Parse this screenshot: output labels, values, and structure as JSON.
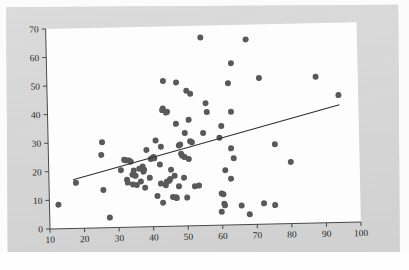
{
  "figure": {
    "background_color": "#d9d9d9",
    "plot_background_color": "#ffffff",
    "point_color": "#5a5a5a",
    "line_color": "#2e2e2e",
    "axis_color": "#4a4a4a"
  },
  "chart_data": {
    "type": "scatter",
    "title": "",
    "subtitle": "",
    "xlabel": "",
    "ylabel": "",
    "xlim": [
      10,
      100
    ],
    "ylim": [
      0,
      70
    ],
    "xticks": [
      10,
      20,
      30,
      40,
      50,
      60,
      70,
      80,
      90,
      100
    ],
    "yticks": [
      0,
      10,
      20,
      30,
      40,
      50,
      60,
      70
    ],
    "xticklabels": [
      "10",
      "20",
      "30",
      "40",
      "50",
      "60",
      "70",
      "80",
      "90",
      "100"
    ],
    "yticklabels": [
      "0",
      "10",
      "20",
      "30",
      "40",
      "50",
      "60",
      "70"
    ],
    "grid": false,
    "legend": null,
    "annotations": [],
    "marker": "circle",
    "marker_size": 3,
    "points": [
      [
        12.6,
        8.4
      ],
      [
        17.8,
        15.9
      ],
      [
        25.3,
        25.5
      ],
      [
        25.6,
        29.9
      ],
      [
        25.7,
        13.2
      ],
      [
        27.4,
        3.5
      ],
      [
        30.9,
        20.0
      ],
      [
        31.9,
        23.6
      ],
      [
        32.4,
        23.4
      ],
      [
        32.6,
        16.6
      ],
      [
        32.8,
        15.6
      ],
      [
        33.3,
        23.3
      ],
      [
        33.8,
        22.9
      ],
      [
        34.2,
        18.3
      ],
      [
        34.3,
        14.9
      ],
      [
        34.6,
        19.8
      ],
      [
        35.1,
        17.9
      ],
      [
        35.4,
        14.7
      ],
      [
        36.2,
        20.4
      ],
      [
        36.6,
        15.9
      ],
      [
        37.2,
        21.1
      ],
      [
        37.4,
        19.3
      ],
      [
        37.6,
        20.0
      ],
      [
        37.8,
        13.7
      ],
      [
        38.4,
        26.9
      ],
      [
        39.2,
        17.1
      ],
      [
        39.6,
        23.7
      ],
      [
        40.1,
        24.0
      ],
      [
        40.4,
        24.4
      ],
      [
        40.6,
        23.9
      ],
      [
        41.1,
        30.1
      ],
      [
        41.3,
        10.7
      ],
      [
        42.2,
        21.7
      ],
      [
        42.4,
        15.0
      ],
      [
        42.6,
        27.9
      ],
      [
        42.9,
        8.3
      ],
      [
        43.2,
        40.7
      ],
      [
        43.4,
        41.3
      ],
      [
        43.6,
        50.9
      ],
      [
        43.8,
        14.4
      ],
      [
        44.1,
        15.6
      ],
      [
        44.3,
        39.8
      ],
      [
        44.6,
        40.1
      ],
      [
        44.8,
        15.9
      ],
      [
        45.1,
        16.5
      ],
      [
        45.4,
        19.8
      ],
      [
        45.8,
        10.2
      ],
      [
        46.4,
        17.6
      ],
      [
        46.7,
        10.1
      ],
      [
        46.9,
        9.8
      ],
      [
        47.1,
        35.8
      ],
      [
        47.4,
        50.3
      ],
      [
        47.6,
        13.9
      ],
      [
        47.8,
        28.2
      ],
      [
        48.2,
        28.5
      ],
      [
        48.4,
        25.3
      ],
      [
        48.7,
        24.6
      ],
      [
        49.1,
        16.9
      ],
      [
        49.4,
        24.1
      ],
      [
        49.6,
        32.5
      ],
      [
        49.9,
        9.9
      ],
      [
        50.3,
        47.3
      ],
      [
        50.6,
        23.4
      ],
      [
        50.8,
        37.1
      ],
      [
        51.1,
        29.6
      ],
      [
        51.4,
        46.2
      ],
      [
        51.6,
        29.2
      ],
      [
        52.2,
        13.8
      ],
      [
        53.4,
        14.0
      ],
      [
        54.7,
        65.8
      ],
      [
        54.9,
        32.4
      ],
      [
        55.8,
        42.8
      ],
      [
        56.1,
        39.7
      ],
      [
        59.6,
        30.6
      ],
      [
        59.8,
        4.7
      ],
      [
        59.9,
        11.1
      ],
      [
        60.2,
        34.7
      ],
      [
        60.4,
        10.8
      ],
      [
        60.6,
        7.5
      ],
      [
        60.8,
        6.9
      ],
      [
        61.1,
        19.2
      ],
      [
        62.4,
        49.6
      ],
      [
        62.7,
        16.2
      ],
      [
        62.9,
        26.8
      ],
      [
        63.1,
        39.6
      ],
      [
        63.4,
        56.6
      ],
      [
        63.6,
        23.3
      ],
      [
        65.6,
        6.7
      ],
      [
        67.8,
        64.8
      ],
      [
        67.9,
        3.6
      ],
      [
        71.4,
        51.2
      ],
      [
        72.1,
        7.3
      ],
      [
        75.3,
        6.6
      ],
      [
        75.6,
        27.9
      ],
      [
        80.1,
        21.6
      ],
      [
        87.8,
        51.2
      ],
      [
        94.3,
        44.6
      ]
    ],
    "fit_line": {
      "type": "linear",
      "x_start": 17.0,
      "y_start": 17.0,
      "x_end": 94.5,
      "y_end": 41.2,
      "slope": 0.312,
      "intercept": 11.69
    }
  }
}
